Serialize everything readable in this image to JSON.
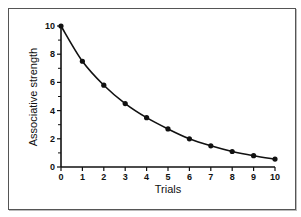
{
  "chart_data": {
    "type": "line",
    "title": "",
    "xlabel": "Trials",
    "ylabel": "Associative strength",
    "x": [
      0,
      1,
      2,
      3,
      4,
      5,
      6,
      7,
      8,
      9,
      10
    ],
    "series": [
      {
        "name": "Associative strength",
        "values": [
          10,
          7.5,
          5.8,
          4.5,
          3.5,
          2.7,
          2.0,
          1.5,
          1.1,
          0.8,
          0.56
        ],
        "markers": true,
        "color": "#111111"
      }
    ],
    "xlim": [
      0,
      10
    ],
    "ylim": [
      0,
      10
    ],
    "xticks": [
      0,
      1,
      2,
      3,
      4,
      5,
      6,
      7,
      8,
      9,
      10
    ],
    "yticks": [
      0,
      2,
      4,
      6,
      8,
      10
    ],
    "y_minor_ticks": [
      1,
      3,
      5,
      7,
      9
    ],
    "grid": false,
    "legend": null
  },
  "layout": {
    "plot": {
      "x0": 61,
      "x1": 275,
      "y0": 167,
      "y1": 26
    }
  }
}
